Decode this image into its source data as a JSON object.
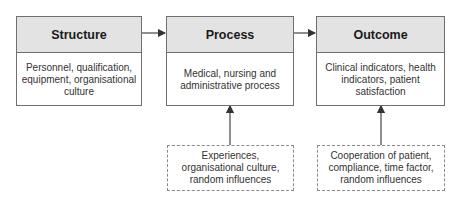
{
  "diagram": {
    "type": "flow",
    "main_boxes": [
      {
        "id": "structure",
        "title": "Structure",
        "lines": [
          "Personnel, qualification,",
          "equipment, organisational",
          "culture"
        ]
      },
      {
        "id": "process",
        "title": "Process",
        "lines": [
          "Medical, nursing and",
          "administrative process"
        ]
      },
      {
        "id": "outcome",
        "title": "Outcome",
        "lines": [
          "Clinical indicators, health",
          "indicators, patient",
          "satisfaction"
        ]
      }
    ],
    "influence_boxes": [
      {
        "id": "process-influences",
        "target": "process",
        "lines": [
          "Experiences,",
          "organisational culture,",
          "random influences"
        ]
      },
      {
        "id": "outcome-influences",
        "target": "outcome",
        "lines": [
          "Cooperation of patient,",
          "compliance, time factor,",
          "random influences"
        ]
      }
    ],
    "edges": [
      {
        "from": "structure",
        "to": "process"
      },
      {
        "from": "process",
        "to": "outcome"
      },
      {
        "from": "process-influences",
        "to": "process"
      },
      {
        "from": "outcome-influences",
        "to": "outcome"
      }
    ],
    "colors": {
      "header_fill": "#e3e3e3",
      "border": "#6f6f6f",
      "arrow": "#444444"
    }
  }
}
